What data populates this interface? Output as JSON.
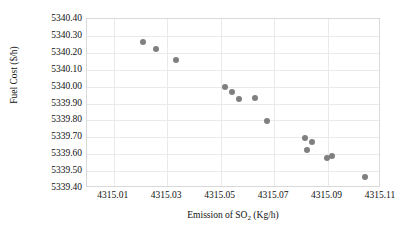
{
  "chart_data": {
    "type": "scatter",
    "title": "",
    "xlabel": "Emission of SO2 (Kg/h)",
    "xlabel_prefix": "Emission of SO",
    "xlabel_sub": "2",
    "xlabel_suffix": " (Kg/h)",
    "ylabel": "Fuel Cost ($/h)",
    "xlim": [
      4315.0,
      4315.11
    ],
    "ylim": [
      5339.4,
      5340.4
    ],
    "grid": true,
    "legend": "none",
    "marker_color": "#7f7f7f",
    "gridline_color": "#eaeaea",
    "border_color": "#d9d9d9",
    "xticks": [
      "4315.01",
      "4315.03",
      "4315.05",
      "4315.07",
      "4315.09",
      "4315.11"
    ],
    "xtick_values": [
      4315.01,
      4315.03,
      4315.05,
      4315.07,
      4315.09,
      4315.11
    ],
    "yticks": [
      "5339.40",
      "5339.50",
      "5339.60",
      "5339.70",
      "5339.80",
      "5339.90",
      "5340.00",
      "5340.10",
      "5340.20",
      "5340.30",
      "5340.40"
    ],
    "ytick_values": [
      5339.4,
      5339.5,
      5339.6,
      5339.7,
      5339.8,
      5339.9,
      5340.0,
      5340.1,
      5340.2,
      5340.3,
      5340.4
    ],
    "x": [
      4315.0209,
      4315.026,
      4315.0334,
      4315.0516,
      4315.0543,
      4315.057,
      4315.0628,
      4315.0675,
      4315.0814,
      4315.0841,
      4315.0822,
      4315.0899,
      4315.0915,
      4315.1039
    ],
    "y": [
      5340.2645,
      5340.2231,
      5340.158,
      5339.997,
      5339.9675,
      5339.926,
      5339.9319,
      5339.7959,
      5339.6953,
      5339.6716,
      5339.6243,
      5339.577,
      5339.5888,
      5339.4645
    ],
    "points": [
      {
        "x": 4315.0209,
        "y": 5340.2645
      },
      {
        "x": 4315.026,
        "y": 5340.2231
      },
      {
        "x": 4315.0334,
        "y": 5340.158
      },
      {
        "x": 4315.0516,
        "y": 5339.997
      },
      {
        "x": 4315.0543,
        "y": 5339.9675
      },
      {
        "x": 4315.057,
        "y": 5339.926
      },
      {
        "x": 4315.0628,
        "y": 5339.9319
      },
      {
        "x": 4315.0675,
        "y": 5339.7959
      },
      {
        "x": 4315.0814,
        "y": 5339.6953
      },
      {
        "x": 4315.0841,
        "y": 5339.6716
      },
      {
        "x": 4315.0822,
        "y": 5339.6243
      },
      {
        "x": 4315.0899,
        "y": 5339.577
      },
      {
        "x": 4315.0915,
        "y": 5339.5888
      },
      {
        "x": 4315.1039,
        "y": 5339.4645
      }
    ]
  }
}
